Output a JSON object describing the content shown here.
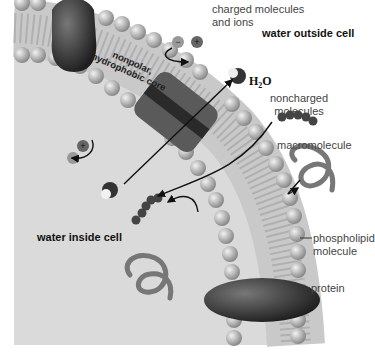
{
  "diagram": {
    "regions": {
      "outside": "water outside cell",
      "inside": "water inside cell",
      "core_line1": "nonpolar,",
      "core_line2": "hydrophobic core"
    },
    "labels": {
      "charged_line1": "charged molecules",
      "charged_line2": "and ions",
      "water_formula": "H",
      "water_sub": "2",
      "water_o": "O",
      "noncharged_line1": "noncharged",
      "noncharged_line2": "molecules",
      "macromolecule": "macromolecule",
      "phospholipid_line1": "phospholipid",
      "phospholipid_line2": "molecule",
      "protein": "protein"
    },
    "ions": {
      "negative": "−",
      "positive": "+"
    },
    "colors": {
      "interior": "#d9d9d9",
      "head": "#a8a8a8",
      "protein": "#3a3a3a",
      "text": "#444444"
    }
  }
}
